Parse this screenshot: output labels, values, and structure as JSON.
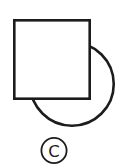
{
  "figure": {
    "label": "C",
    "shapes": [
      {
        "name": "circle",
        "layer": "behind"
      },
      {
        "name": "square",
        "layer": "front"
      }
    ]
  },
  "colors": {
    "stroke": "#1c1c1c",
    "background": "#ffffff"
  }
}
